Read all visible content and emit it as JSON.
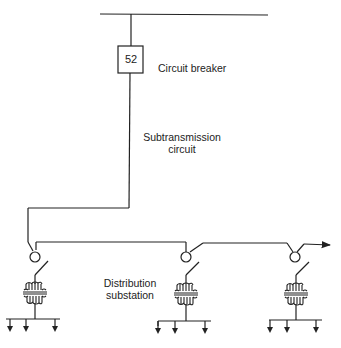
{
  "diagram": {
    "title": "",
    "breaker": {
      "code": "52",
      "label": "Circuit breaker"
    },
    "subtransmission": {
      "line1": "Subtransmission",
      "line2": "circuit"
    },
    "substation": {
      "line1": "Distribution",
      "line2": "substation"
    },
    "substations_count": 3,
    "colors": {
      "line": "#222222",
      "background": "#ffffff"
    }
  }
}
